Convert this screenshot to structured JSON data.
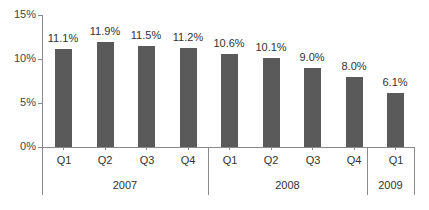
{
  "chart_data": {
    "type": "bar",
    "title": "",
    "xlabel": "",
    "ylabel": "",
    "ylim": [
      0,
      15
    ],
    "yticks": [
      "0%",
      "5%",
      "10%",
      "15%"
    ],
    "grid": false,
    "legend": null,
    "categories": [
      "2007 Q1",
      "2007 Q2",
      "2007 Q3",
      "2007 Q4",
      "2008 Q1",
      "2008 Q2",
      "2008 Q3",
      "2008 Q4",
      "2009 Q1"
    ],
    "quarters": [
      "Q1",
      "Q2",
      "Q3",
      "Q4",
      "Q1",
      "Q2",
      "Q3",
      "Q4",
      "Q1"
    ],
    "groups": [
      {
        "label": "2007",
        "count": 4
      },
      {
        "label": "2008",
        "count": 4
      },
      {
        "label": "2009",
        "count": 1
      }
    ],
    "values": [
      11.1,
      11.9,
      11.5,
      11.2,
      10.6,
      10.1,
      9.0,
      8.0,
      6.1
    ],
    "value_labels": [
      "11.1%",
      "11.9%",
      "11.5%",
      "11.2%",
      "10.6%",
      "10.1%",
      "9.0%",
      "8.0%",
      "6.1%"
    ],
    "bar_color": "#5a5a5a"
  }
}
